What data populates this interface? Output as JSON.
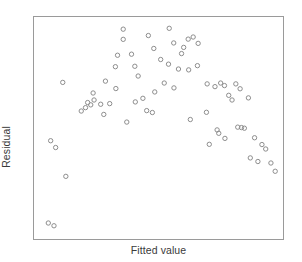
{
  "figure": {
    "background_color": "#ffffff",
    "frame_color": "#9a9a9a",
    "marker_color": "#8c8c8c",
    "label_color": "#3a3a3a"
  },
  "chart_data": {
    "type": "scatter",
    "title": "",
    "xlabel": "Fitted value",
    "ylabel": "Residual",
    "grid": false,
    "legend": false,
    "xtick_labels": [],
    "ytick_labels": [],
    "xlim": [
      0,
      100
    ],
    "ylim": [
      0,
      100
    ],
    "marker_style": "open-circle",
    "marker_radius_px": 2.2,
    "n_points": 71,
    "series": [
      {
        "name": "residuals",
        "points": [
          [
            3.1,
            5.2
          ],
          [
            5.5,
            3.9
          ],
          [
            4.1,
            44.0
          ],
          [
            6.2,
            40.8
          ],
          [
            10.5,
            27.2
          ],
          [
            9.2,
            71.5
          ],
          [
            19.7,
            62.0
          ],
          [
            22.0,
            66.5
          ],
          [
            22.4,
            63.2
          ],
          [
            21.0,
            60.9
          ],
          [
            25.2,
            61.2
          ],
          [
            29.0,
            61.5
          ],
          [
            34.7,
            91.8
          ],
          [
            32.3,
            84.3
          ],
          [
            31.4,
            78.9
          ],
          [
            27.2,
            72.1
          ],
          [
            31.6,
            68.6
          ],
          [
            38.2,
            84.8
          ],
          [
            39.6,
            79.1
          ],
          [
            34.7,
            96.6
          ],
          [
            41.0,
            74.5
          ],
          [
            45.3,
            93.6
          ],
          [
            47.6,
            87.5
          ],
          [
            50.5,
            82.3
          ],
          [
            54.1,
            97.0
          ],
          [
            56.0,
            90.1
          ],
          [
            59.3,
            85.1
          ],
          [
            62.1,
            91.9
          ],
          [
            64.2,
            92.9
          ],
          [
            66.3,
            89.9
          ],
          [
            60.2,
            88.0
          ],
          [
            53.8,
            80.1
          ],
          [
            58.0,
            77.8
          ],
          [
            52.0,
            71.2
          ],
          [
            48.0,
            67.0
          ],
          [
            56.1,
            68.9
          ],
          [
            43.0,
            64.0
          ],
          [
            39.8,
            62.3
          ],
          [
            47.0,
            57.3
          ],
          [
            62.3,
            77.4
          ],
          [
            66.0,
            79.4
          ],
          [
            70.1,
            70.8
          ],
          [
            73.4,
            69.5
          ],
          [
            75.8,
            71.2
          ],
          [
            77.4,
            70.0
          ],
          [
            82.2,
            70.8
          ],
          [
            84.0,
            68.5
          ],
          [
            79.2,
            65.4
          ],
          [
            80.6,
            63.2
          ],
          [
            87.5,
            64.2
          ],
          [
            69.8,
            57.4
          ],
          [
            74.3,
            49.1
          ],
          [
            75.0,
            47.5
          ],
          [
            71.0,
            42.3
          ],
          [
            83.0,
            50.4
          ],
          [
            84.6,
            50.2
          ],
          [
            85.8,
            49.9
          ],
          [
            77.6,
            45.1
          ],
          [
            90.1,
            45.4
          ],
          [
            93.2,
            42.2
          ],
          [
            94.8,
            40.1
          ],
          [
            88.3,
            35.9
          ],
          [
            91.5,
            34.2
          ],
          [
            97.0,
            33.5
          ],
          [
            98.8,
            29.6
          ],
          [
            17.0,
            58.0
          ],
          [
            18.8,
            59.6
          ],
          [
            26.5,
            56.4
          ],
          [
            36.2,
            52.8
          ],
          [
            44.6,
            58.2
          ],
          [
            63.0,
            54.0
          ]
        ]
      }
    ]
  },
  "labels": {
    "x_axis": "Fitted value",
    "y_axis": "Residual"
  }
}
